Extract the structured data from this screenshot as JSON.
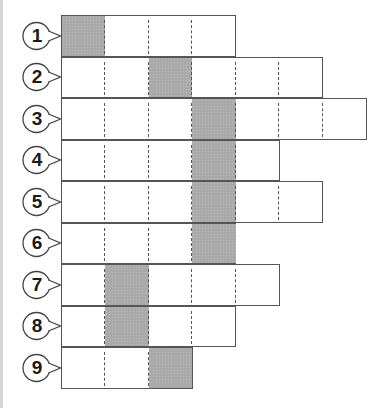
{
  "diagram": {
    "type": "grid-rows-with-shaded-cell",
    "cell_width_px": 43.5,
    "colors": {
      "border": "#555555",
      "shaded": "#a9a9a9",
      "background": "#ffffff",
      "badge_text": "#1a1a1a"
    },
    "rows": [
      {
        "label": "1",
        "cells": 4,
        "shaded_index": 0
      },
      {
        "label": "2",
        "cells": 6,
        "shaded_index": 2
      },
      {
        "label": "3",
        "cells": 7,
        "shaded_index": 3
      },
      {
        "label": "4",
        "cells": 5,
        "shaded_index": 3
      },
      {
        "label": "5",
        "cells": 6,
        "shaded_index": 3
      },
      {
        "label": "6",
        "cells": 4,
        "shaded_index": 3
      },
      {
        "label": "7",
        "cells": 5,
        "shaded_index": 1
      },
      {
        "label": "8",
        "cells": 4,
        "shaded_index": 1
      },
      {
        "label": "9",
        "cells": 3,
        "shaded_index": 2
      }
    ]
  }
}
